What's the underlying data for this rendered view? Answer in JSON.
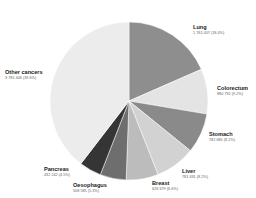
{
  "chart_data": {
    "type": "pie",
    "title": "",
    "start_angle_deg": 0,
    "direction": "clockwise",
    "center": [
      129,
      101
    ],
    "radius": 79,
    "slices": [
      {
        "name": "Lung",
        "value": 1761007,
        "label": "1 761 007 (18.4%)",
        "percent": 18.4,
        "color": "#8e8e8e",
        "label_pos": [
          193,
          25
        ]
      },
      {
        "name": "Colorectum",
        "value": 880792,
        "label": "880 792 (9.2%)",
        "percent": 9.2,
        "color": "#e4e4e4",
        "label_pos": [
          217,
          86
        ]
      },
      {
        "name": "Stomach",
        "value": 782685,
        "label": "782 685 (8.2%)",
        "percent": 8.2,
        "color": "#8a8a8a",
        "label_pos": [
          209,
          132
        ]
      },
      {
        "name": "Liver",
        "value": 781631,
        "label": "781 631 (8.2%)",
        "percent": 8.2,
        "color": "#d2d2d2",
        "label_pos": [
          182,
          169
        ]
      },
      {
        "name": "Breast",
        "value": 626679,
        "label": "626 679 (6.6%)",
        "percent": 6.6,
        "color": "#bcbcbc",
        "label_pos": [
          152,
          181
        ]
      },
      {
        "name": "Oesophagus",
        "value": 508585,
        "label": "508 585 (5.3%)",
        "percent": 5.3,
        "color": "#6e6e6e",
        "label_pos": [
          73,
          183
        ]
      },
      {
        "name": "Pancreas",
        "value": 432242,
        "label": "432 242 (4.5%)",
        "percent": 4.5,
        "color": "#353535",
        "label_pos": [
          44,
          167
        ]
      },
      {
        "name": "Other cancers",
        "value": 3781406,
        "label": "3 781 406 (39.6%)",
        "percent": 39.6,
        "color": "#ececec",
        "label_pos": [
          5,
          70
        ]
      }
    ]
  }
}
